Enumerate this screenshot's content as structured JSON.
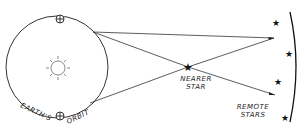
{
  "diagram": {
    "type": "stellar-parallax",
    "labels": {
      "orbit": [
        "EARTH'S",
        "ORBIT"
      ],
      "nearer_star": [
        "NEARER",
        "STAR"
      ],
      "remote_stars": [
        "REMOTE",
        "STARS"
      ]
    },
    "elements": {
      "sun": "sun-icon",
      "earth_positions": 2,
      "remote_star_count": 4
    },
    "colors": {
      "ink": "#222222",
      "background": "#ffffff"
    }
  }
}
